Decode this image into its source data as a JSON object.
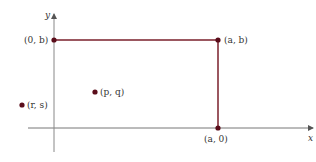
{
  "diagram": {
    "axes": {
      "x_label": "x",
      "y_label": "y"
    },
    "rectangle_color": "#7a1f2b",
    "point_color": "#6b1020",
    "axis_color": "#777777",
    "points": [
      {
        "id": "origin-b",
        "label": "(0, b)"
      },
      {
        "id": "a-b",
        "label": "(a, b)"
      },
      {
        "id": "a-0",
        "label": "(a, 0)"
      },
      {
        "id": "p-q",
        "label": "(p, q)"
      },
      {
        "id": "r-s",
        "label": "(r, s)"
      }
    ]
  }
}
